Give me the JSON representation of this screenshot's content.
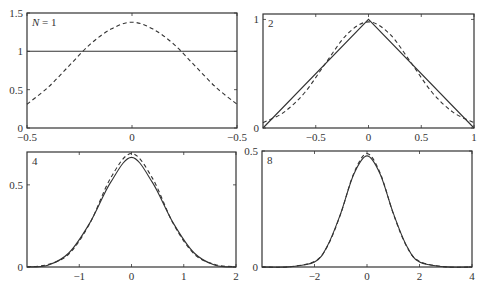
{
  "figure": {
    "line_color": "#333333"
  },
  "chart_data": [
    {
      "type": "line",
      "panel_label": "N = 1",
      "N": 1,
      "xlim": [
        -0.5,
        0.5
      ],
      "ylim": [
        0,
        1.5
      ],
      "xticks": [
        -0.5,
        0,
        0.5
      ],
      "xtick_labels": [
        "-0.5",
        "0",
        "-0.5"
      ],
      "yticks": [
        0,
        0.5,
        1,
        1.5
      ],
      "ytick_labels": [
        "0",
        "0.5",
        "1",
        "1.5"
      ],
      "grid": false,
      "series": [
        {
          "name": "sum of uniforms",
          "style": "solid",
          "x": [
            -0.5,
            -0.25,
            0,
            0.25,
            0.5
          ],
          "y": [
            1,
            1,
            1,
            1,
            1
          ]
        },
        {
          "name": "gaussian",
          "style": "dashed",
          "x": [
            -0.5,
            -0.4,
            -0.3,
            -0.2,
            -0.1,
            0,
            0.1,
            0.2,
            0.3,
            0.4,
            0.5
          ],
          "y": [
            0.31,
            0.53,
            0.81,
            1.09,
            1.29,
            1.38,
            1.29,
            1.09,
            0.81,
            0.53,
            0.31
          ]
        }
      ]
    },
    {
      "type": "line",
      "panel_label": "2",
      "N": 2,
      "xlim": [
        -1,
        1
      ],
      "ylim": [
        0,
        1.05
      ],
      "xticks": [
        -0.5,
        0,
        0.5,
        1
      ],
      "xtick_labels": [
        "-0.5",
        "0",
        "0.5",
        "1"
      ],
      "yticks": [
        0,
        1
      ],
      "ytick_labels": [
        "0",
        "1"
      ],
      "grid": false,
      "series": [
        {
          "name": "sum of uniforms",
          "style": "solid",
          "x": [
            -1,
            0,
            1
          ],
          "y": [
            0,
            1,
            0
          ]
        },
        {
          "name": "gaussian",
          "style": "dashed",
          "x": [
            -1,
            -0.8,
            -0.6,
            -0.4,
            -0.2,
            0,
            0.2,
            0.4,
            0.6,
            0.8,
            1
          ],
          "y": [
            0.049,
            0.146,
            0.332,
            0.606,
            0.867,
            0.977,
            0.867,
            0.606,
            0.332,
            0.146,
            0.049
          ]
        }
      ]
    },
    {
      "type": "line",
      "panel_label": "4",
      "N": 4,
      "xlim": [
        -2,
        2
      ],
      "ylim": [
        0,
        0.7
      ],
      "xticks": [
        -1,
        0,
        1,
        2
      ],
      "xtick_labels": [
        "-1",
        "0",
        "1",
        "2"
      ],
      "yticks": [
        0,
        0.5
      ],
      "ytick_labels": [
        "0",
        "0.5"
      ],
      "grid": false,
      "series": [
        {
          "name": "sum of uniforms",
          "style": "solid",
          "x": [
            -2,
            -1.6,
            -1.2,
            -0.8,
            -0.4,
            0,
            0.4,
            0.8,
            1.2,
            1.6,
            2
          ],
          "y": [
            0,
            0.011,
            0.085,
            0.267,
            0.515,
            0.667,
            0.515,
            0.267,
            0.085,
            0.011,
            0
          ]
        },
        {
          "name": "gaussian",
          "style": "dashed",
          "x": [
            -2,
            -1.6,
            -1.2,
            -0.8,
            -0.4,
            0,
            0.4,
            0.8,
            1.2,
            1.6,
            2
          ],
          "y": [
            0.0017,
            0.015,
            0.079,
            0.264,
            0.541,
            0.691,
            0.541,
            0.264,
            0.079,
            0.015,
            0.0017
          ]
        }
      ]
    },
    {
      "type": "line",
      "panel_label": "8",
      "N": 8,
      "xlim": [
        -4,
        4
      ],
      "ylim": [
        0,
        0.5
      ],
      "xticks": [
        -2,
        0,
        2,
        4
      ],
      "xtick_labels": [
        "-2",
        "0",
        "2",
        "4"
      ],
      "yticks": [
        0,
        0.5
      ],
      "ytick_labels": [
        "0",
        "0.5"
      ],
      "grid": false,
      "series": [
        {
          "name": "sum of uniforms",
          "style": "solid",
          "x": [
            -4,
            -3,
            -2,
            -1.5,
            -1,
            -0.5,
            0,
            0.5,
            1,
            1.5,
            2,
            3,
            4
          ],
          "y": [
            0,
            0.0006,
            0.021,
            0.093,
            0.232,
            0.401,
            0.479,
            0.401,
            0.232,
            0.093,
            0.021,
            0.0006,
            0
          ]
        },
        {
          "name": "gaussian",
          "style": "dashed",
          "x": [
            -4,
            -3,
            -2,
            -1.5,
            -1,
            -0.5,
            0,
            0.5,
            1,
            1.5,
            2,
            3,
            4
          ],
          "y": [
            0,
            0.0006,
            0.024,
            0.091,
            0.23,
            0.405,
            0.489,
            0.405,
            0.23,
            0.091,
            0.024,
            0.0006,
            0
          ]
        }
      ]
    }
  ]
}
